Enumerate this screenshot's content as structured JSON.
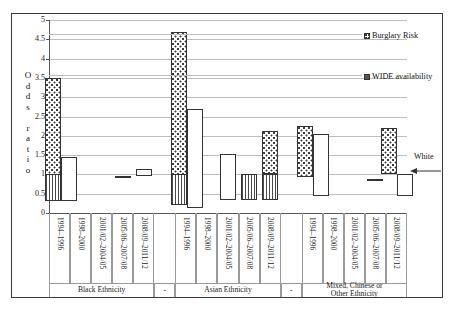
{
  "chart_data": {
    "type": "bar",
    "title": "",
    "xlabel": "",
    "ylabel": "Odds ratio",
    "ylim": [
      0,
      5
    ],
    "yticks": [
      "0",
      "0.5",
      "1",
      "1.5",
      "2",
      "2.5",
      "3",
      "3.5",
      "4",
      "4.5",
      "5"
    ],
    "grid": true,
    "legend_position": "top-right",
    "reference_line": 1,
    "reference_label": "White",
    "categories": [
      "1994–1996",
      "1998–2000",
      "2001/02–2004/05",
      "2005/06–2007/08",
      "2008/09–2011/12"
    ],
    "groups": [
      {
        "name": "Black Ethnicity",
        "bars": [
          {
            "period": "1994–1996",
            "burglary_top": 3.5,
            "burglary_bottom": 0.3,
            "wide_top": 1.0,
            "wide_bottom": 0.3,
            "plain_top": 1.45,
            "plain_bottom": 0.3
          },
          {
            "period": "1998–2000",
            "burglary_top": null,
            "burglary_bottom": null,
            "wide_top": null,
            "wide_bottom": null,
            "plain_top": null,
            "plain_bottom": null
          },
          {
            "period": "2001/02–2004/05",
            "burglary_top": null,
            "burglary_bottom": null,
            "wide_top": null,
            "wide_bottom": null,
            "plain_top": null,
            "plain_bottom": null
          },
          {
            "period": "2005/06–2007/08",
            "burglary_top": null,
            "burglary_bottom": null,
            "wide_top": null,
            "wide_bottom": null,
            "plain_top": 0.97,
            "plain_bottom": 0.92
          },
          {
            "period": "2008/09–2011/12",
            "burglary_top": null,
            "burglary_bottom": null,
            "wide_top": null,
            "wide_bottom": null,
            "plain_top": 1.13,
            "plain_bottom": 0.95
          }
        ]
      },
      {
        "name": "Asian Ethnicity",
        "bars": [
          {
            "period": "1994–1996",
            "burglary_top": 4.7,
            "burglary_bottom": 0.2,
            "wide_top": 1.0,
            "wide_bottom": 0.2,
            "plain_top": 2.7,
            "plain_bottom": 0.12
          },
          {
            "period": "1998–2000",
            "burglary_top": null,
            "burglary_bottom": null,
            "wide_top": null,
            "wide_bottom": null,
            "plain_top": null,
            "plain_bottom": null
          },
          {
            "period": "2001/02–2004/05",
            "burglary_top": null,
            "burglary_bottom": null,
            "wide_top": null,
            "wide_bottom": null,
            "plain_top": 1.52,
            "plain_bottom": 0.33
          },
          {
            "period": "2005/06–2007/08",
            "burglary_top": null,
            "burglary_bottom": null,
            "wide_top": 1.0,
            "wide_bottom": 0.33,
            "plain_top": null,
            "plain_bottom": null
          },
          {
            "period": "2008/09–2011/12",
            "burglary_top": 2.12,
            "burglary_bottom": 1.0,
            "wide_top": 1.0,
            "wide_bottom": 0.33,
            "plain_top": null,
            "plain_bottom": null
          }
        ]
      },
      {
        "name": "Mixed, Chinese or Other Ethnicity",
        "bars": [
          {
            "period": "1994–1996",
            "burglary_top": 2.25,
            "burglary_bottom": 0.93,
            "wide_top": null,
            "wide_bottom": null,
            "plain_top": 2.05,
            "plain_bottom": 0.45
          },
          {
            "period": "1998–2000",
            "burglary_top": null,
            "burglary_bottom": null,
            "wide_top": null,
            "wide_bottom": null,
            "plain_top": null,
            "plain_bottom": null
          },
          {
            "period": "2001/02–2004/05",
            "burglary_top": null,
            "burglary_bottom": null,
            "wide_top": null,
            "wide_bottom": null,
            "plain_top": null,
            "plain_bottom": null
          },
          {
            "period": "2005/06–2007/08",
            "burglary_top": null,
            "burglary_bottom": null,
            "wide_top": null,
            "wide_bottom": null,
            "plain_top": 0.88,
            "plain_bottom": 0.83
          },
          {
            "period": "2008/09–2011/12",
            "burglary_top": 2.2,
            "burglary_bottom": 1.0,
            "wide_top": null,
            "wide_bottom": null,
            "plain_top": 1.0,
            "plain_bottom": 0.45
          }
        ]
      }
    ],
    "series": [
      {
        "name": "Burglary Risk",
        "pattern": "dotted"
      },
      {
        "name": "WIDE availability",
        "pattern": "vertical-stripes"
      }
    ]
  },
  "legend": {
    "items": [
      {
        "label": "Burglary Risk",
        "key": "dotted"
      },
      {
        "label": "WIDE availability",
        "key": "striped"
      }
    ]
  },
  "annotation": {
    "white_label": "White"
  },
  "axis": {
    "y_title_letters": [
      "O",
      "d",
      "d",
      "s",
      "",
      "r",
      "a",
      "t",
      "i",
      "o"
    ],
    "y_title_text": "Odds ratio"
  },
  "separators": [
    "-",
    "-"
  ]
}
